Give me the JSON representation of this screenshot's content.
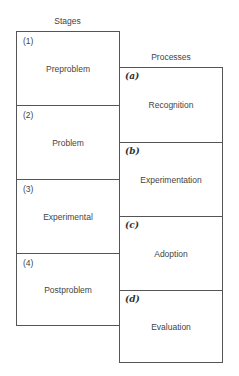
{
  "diagram": {
    "stages": {
      "title": "Stages",
      "items": [
        {
          "marker": "(1)",
          "label": "Preproblem"
        },
        {
          "marker": "(2)",
          "label": "Problem"
        },
        {
          "marker": "(3)",
          "label": "Experimental"
        },
        {
          "marker": "(4)",
          "label": "Postproblem"
        }
      ]
    },
    "processes": {
      "title": "Processes",
      "items": [
        {
          "marker": "(a)",
          "label": "Recognition"
        },
        {
          "marker": "(b)",
          "label": "Experimentation"
        },
        {
          "marker": "(c)",
          "label": "Adoption"
        },
        {
          "marker": "(d)",
          "label": "Evaluation"
        }
      ]
    },
    "colors": {
      "line": "#555555",
      "text": "#444444",
      "background": "#ffffff"
    }
  }
}
